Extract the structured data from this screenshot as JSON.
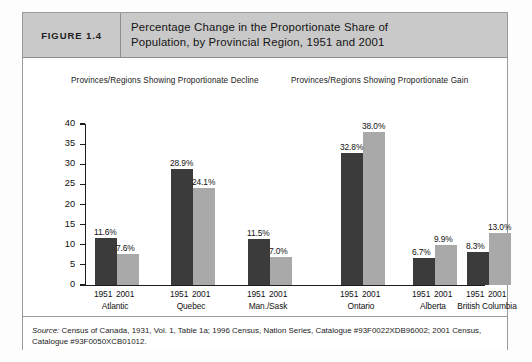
{
  "figure": {
    "tag": "FIGURE 1.4",
    "title_line1": "Percentage Change in the Proportionate Share of",
    "title_line2": "Population, by Provincial Region, 1951 and 2001",
    "source_label": "Source:",
    "source_line1": " Census of Canada, 1931, Vol. 1, Table 1a; 1996 Census, Nation Series, Catalogue #93F0022XDB96002; 2001",
    "source_line2": "Census, Catalogue #93F0050XCB01012."
  },
  "panels": {
    "left_subtitle": "Provinces/Regions Showing Proportionate Decline",
    "right_subtitle": "Provinces/Regions Showing Proportionate Gain"
  },
  "colors": {
    "series_1951": "#3b3b3b",
    "series_2001": "#a9a9a9",
    "header_band": "#c9c9c9",
    "frame_border": "#9a9a9a",
    "axis": "#1c1c1c"
  },
  "chart_data": {
    "type": "bar",
    "title": "Percentage Change in the Proportionate Share of Population, by Provincial Region, 1951 and 2001",
    "xlabel": "",
    "ylabel": "",
    "ylim": [
      0,
      40
    ],
    "yticks": [
      0,
      5,
      10,
      15,
      20,
      25,
      30,
      35,
      40
    ],
    "grid": false,
    "legend": "none",
    "categories": [
      "Atlantic",
      "Quebec",
      "Man./Sask",
      "Ontario",
      "Alberta",
      "British Columbia"
    ],
    "series": [
      {
        "name": "1951",
        "values": [
          11.6,
          28.9,
          11.5,
          32.8,
          6.7,
          8.3
        ]
      },
      {
        "name": "2001",
        "values": [
          7.6,
          24.1,
          7.0,
          38.0,
          9.9,
          13.0
        ]
      }
    ],
    "data_labels": [
      [
        "11.6%",
        "7.6%"
      ],
      [
        "28.9%",
        "24.1%"
      ],
      [
        "11.5%",
        "7.0%"
      ],
      [
        "32.8%",
        "38.0%"
      ],
      [
        "6.7%",
        "9.9%"
      ],
      [
        "8.3%",
        "13.0%"
      ]
    ],
    "group_panels": [
      {
        "panel": "Provinces/Regions Showing Proportionate Decline",
        "categories": [
          "Atlantic",
          "Quebec",
          "Man./Sask"
        ]
      },
      {
        "panel": "Provinces/Regions Showing Proportionate Gain",
        "categories": [
          "Ontario",
          "Alberta",
          "British Columbia"
        ]
      }
    ],
    "year_tick_labels": [
      "1951",
      "2001"
    ]
  }
}
